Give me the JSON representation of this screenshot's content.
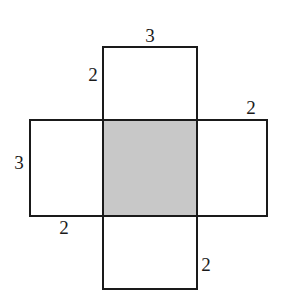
{
  "diagram": {
    "type": "box-net",
    "colors": {
      "stroke": "#1a1a1a",
      "shaded_fill": "#c8c8c8",
      "unshaded_fill": "#ffffff",
      "background": "#ffffff"
    },
    "faces": [
      {
        "id": "center",
        "shaded": true,
        "x": 103,
        "y": 120,
        "w": 94,
        "h": 96
      },
      {
        "id": "top",
        "shaded": false,
        "x": 103,
        "y": 47,
        "w": 94,
        "h": 73
      },
      {
        "id": "bottom",
        "shaded": false,
        "x": 103,
        "y": 216,
        "w": 94,
        "h": 73
      },
      {
        "id": "left",
        "shaded": false,
        "x": 30,
        "y": 120,
        "w": 73,
        "h": 96
      },
      {
        "id": "right",
        "shaded": false,
        "x": 197,
        "y": 120,
        "w": 70,
        "h": 96
      }
    ],
    "labels": [
      {
        "id": "top-width",
        "text": "3",
        "x": 150,
        "y": 38
      },
      {
        "id": "top-height",
        "text": "2",
        "x": 93,
        "y": 77
      },
      {
        "id": "right-width",
        "text": "2",
        "x": 251,
        "y": 110
      },
      {
        "id": "left-height",
        "text": "3",
        "x": 19,
        "y": 165
      },
      {
        "id": "left-width",
        "text": "2",
        "x": 64,
        "y": 230
      },
      {
        "id": "bottom-height",
        "text": "2",
        "x": 206,
        "y": 267
      }
    ]
  }
}
